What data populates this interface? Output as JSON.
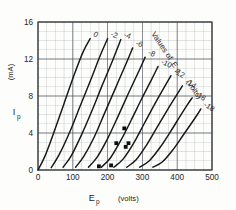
{
  "chart_data": {
    "type": "line",
    "title": "",
    "xlabel": "E_p",
    "xunit": "(volts)",
    "ylabel": "I_p",
    "yunit": "(mA)",
    "xlim": [
      0,
      500
    ],
    "ylim": [
      0,
      16
    ],
    "x_ticks": [
      0,
      100,
      200,
      300,
      400,
      500
    ],
    "y_ticks": [
      0,
      4,
      8,
      12,
      16
    ],
    "x_minor_step": 25,
    "y_minor_step": 1,
    "grid": true,
    "legend_position": "inline-curve-labels",
    "annotation": "Values of Eg   (volts)",
    "annotation_parts": {
      "values_of": "Values of",
      "symbol": "E",
      "symbol_sub": "g",
      "unit": "(volts)"
    },
    "series": [
      {
        "name": "0",
        "label": "0",
        "x": [
          0,
          20,
          45,
          75,
          105,
          130,
          150
        ],
        "y": [
          0.0,
          1.5,
          4.0,
          7.2,
          10.4,
          12.8,
          14.2
        ]
      },
      {
        "name": "-2",
        "label": "-2",
        "x": [
          38,
          60,
          90,
          120,
          150,
          178,
          200
        ],
        "y": [
          0.25,
          1.6,
          4.0,
          6.8,
          9.6,
          12.3,
          14.2
        ]
      },
      {
        "name": "-4",
        "label": "-4",
        "x": [
          72,
          95,
          125,
          155,
          185,
          215,
          238
        ],
        "y": [
          0.3,
          1.5,
          3.8,
          6.4,
          9.2,
          11.9,
          14.1
        ]
      },
      {
        "name": "-6",
        "label": "-6",
        "x": [
          108,
          132,
          162,
          192,
          222,
          252,
          272
        ],
        "y": [
          0.3,
          1.5,
          3.6,
          6.2,
          8.8,
          11.4,
          13.2
        ]
      },
      {
        "name": "-8",
        "label": "-8",
        "x": [
          145,
          170,
          200,
          230,
          260,
          290,
          308
        ],
        "y": [
          0.3,
          1.4,
          3.4,
          5.8,
          8.3,
          10.7,
          12.2
        ]
      },
      {
        "name": "-10",
        "label": "-10",
        "x": [
          182,
          208,
          238,
          268,
          298,
          328,
          345
        ],
        "y": [
          0.3,
          1.3,
          3.2,
          5.4,
          7.7,
          9.9,
          11.2
        ]
      },
      {
        "name": "-12",
        "label": "-12",
        "x": [
          218,
          245,
          275,
          305,
          335,
          365,
          382
        ],
        "y": [
          0.3,
          1.2,
          2.9,
          5.0,
          7.1,
          9.1,
          10.2
        ]
      },
      {
        "name": "-14",
        "label": "-14",
        "x": [
          255,
          282,
          312,
          342,
          372,
          400,
          415
        ],
        "y": [
          0.3,
          1.1,
          2.7,
          4.6,
          6.5,
          8.2,
          9.1
        ]
      },
      {
        "name": "-16",
        "label": "-16",
        "x": [
          292,
          320,
          350,
          380,
          408,
          430,
          443
        ],
        "y": [
          0.3,
          1.0,
          2.4,
          4.1,
          5.8,
          7.1,
          7.8
        ]
      },
      {
        "name": "-18",
        "label": "-18",
        "x": [
          330,
          358,
          388,
          416,
          440,
          458,
          468
        ],
        "y": [
          0.3,
          0.9,
          2.2,
          3.7,
          5.0,
          6.0,
          6.6
        ]
      }
    ],
    "marked_points": [
      {
        "x": 175,
        "y": 0.4
      },
      {
        "x": 210,
        "y": 0.5
      },
      {
        "x": 225,
        "y": 2.9
      },
      {
        "x": 248,
        "y": 4.5
      },
      {
        "x": 252,
        "y": 2.5
      },
      {
        "x": 260,
        "y": 2.9
      }
    ]
  }
}
